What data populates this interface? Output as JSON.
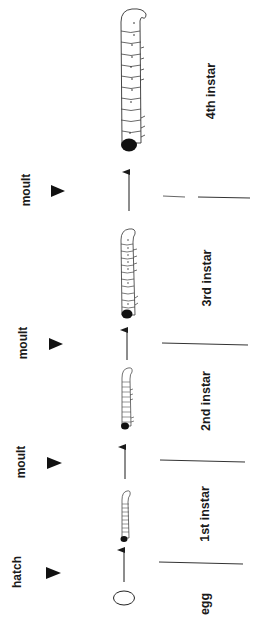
{
  "figure": {
    "orientation": "rotated -90deg (reads bottom to top)",
    "colors": {
      "ink": "#1a1a1a",
      "background": "#ffffff",
      "larva_body": "#ffffff",
      "larva_head": "#111111"
    }
  },
  "events": [
    {
      "id": "hatch",
      "label": "hatch",
      "cx": 17,
      "cy": 572,
      "arrow_y": 573,
      "line_y": 563
    },
    {
      "id": "moult1",
      "label": "moult",
      "cx": 21,
      "cy": 462,
      "arrow_y": 463,
      "line_y": 462
    },
    {
      "id": "moult2",
      "label": "moult",
      "cx": 23,
      "cy": 343,
      "arrow_y": 344,
      "line_y": 344
    },
    {
      "id": "moult3",
      "label": "moult",
      "cx": 26,
      "cy": 190,
      "arrow_y": 191,
      "line_y": 197
    }
  ],
  "stages": [
    {
      "id": "egg",
      "label": "egg",
      "cx": 205,
      "cy": 604
    },
    {
      "id": "instar1",
      "label": "1st instar",
      "cx": 205,
      "cy": 514
    },
    {
      "id": "instar2",
      "label": "2nd instar",
      "cx": 206,
      "cy": 401
    },
    {
      "id": "instar3",
      "label": "3rd instar",
      "cx": 207,
      "cy": 278
    },
    {
      "id": "instar4",
      "label": "4th instar",
      "cx": 211,
      "cy": 91
    }
  ]
}
